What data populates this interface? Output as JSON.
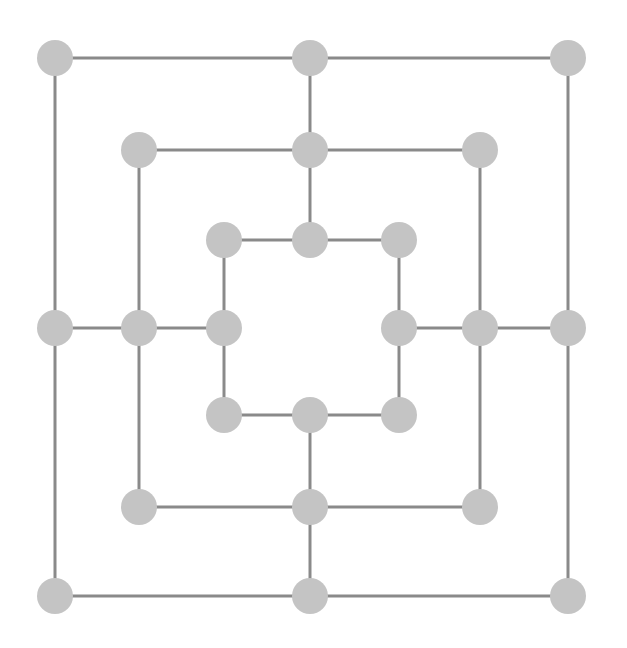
{
  "figure": {
    "kind": "graph-diagram",
    "width": 627,
    "height": 648,
    "background_color": "#ffffff"
  },
  "style": {
    "node_fill": "#c4c4c4",
    "node_stroke": "none",
    "node_radius": 18,
    "edge_color": "#8a8a8a",
    "edge_width": 3
  },
  "graph": {
    "node_count": 24,
    "edge_count": 32,
    "rings": [
      {
        "name": "outer",
        "xs": [
          55,
          310,
          568
        ],
        "ys": [
          58,
          328,
          596
        ]
      },
      {
        "name": "middle",
        "xs": [
          139,
          310,
          480
        ],
        "ys": [
          150,
          328,
          507
        ]
      },
      {
        "name": "inner",
        "xs": [
          224,
          310,
          399
        ],
        "ys": [
          240,
          328,
          415
        ]
      }
    ],
    "nodes": [
      {
        "id": "o-nw",
        "ring": "outer",
        "x": 55,
        "y": 58
      },
      {
        "id": "o-n",
        "ring": "outer",
        "x": 310,
        "y": 58
      },
      {
        "id": "o-ne",
        "ring": "outer",
        "x": 568,
        "y": 58
      },
      {
        "id": "o-w",
        "ring": "outer",
        "x": 55,
        "y": 328
      },
      {
        "id": "o-e",
        "ring": "outer",
        "x": 568,
        "y": 328
      },
      {
        "id": "o-sw",
        "ring": "outer",
        "x": 55,
        "y": 596
      },
      {
        "id": "o-s",
        "ring": "outer",
        "x": 310,
        "y": 596
      },
      {
        "id": "o-se",
        "ring": "outer",
        "x": 568,
        "y": 596
      },
      {
        "id": "m-nw",
        "ring": "middle",
        "x": 139,
        "y": 150
      },
      {
        "id": "m-n",
        "ring": "middle",
        "x": 310,
        "y": 150
      },
      {
        "id": "m-ne",
        "ring": "middle",
        "x": 480,
        "y": 150
      },
      {
        "id": "m-w",
        "ring": "middle",
        "x": 139,
        "y": 328
      },
      {
        "id": "m-e",
        "ring": "middle",
        "x": 480,
        "y": 328
      },
      {
        "id": "m-sw",
        "ring": "middle",
        "x": 139,
        "y": 507
      },
      {
        "id": "m-s",
        "ring": "middle",
        "x": 310,
        "y": 507
      },
      {
        "id": "m-se",
        "ring": "middle",
        "x": 480,
        "y": 507
      },
      {
        "id": "i-nw",
        "ring": "inner",
        "x": 224,
        "y": 240
      },
      {
        "id": "i-n",
        "ring": "inner",
        "x": 310,
        "y": 240
      },
      {
        "id": "i-ne",
        "ring": "inner",
        "x": 399,
        "y": 240
      },
      {
        "id": "i-w",
        "ring": "inner",
        "x": 224,
        "y": 328
      },
      {
        "id": "i-e",
        "ring": "inner",
        "x": 399,
        "y": 328
      },
      {
        "id": "i-sw",
        "ring": "inner",
        "x": 224,
        "y": 415
      },
      {
        "id": "i-s",
        "ring": "inner",
        "x": 310,
        "y": 415
      },
      {
        "id": "i-se",
        "ring": "inner",
        "x": 399,
        "y": 415
      }
    ],
    "edges": [
      [
        "o-nw",
        "o-n"
      ],
      [
        "o-n",
        "o-ne"
      ],
      [
        "o-nw",
        "o-w"
      ],
      [
        "o-w",
        "o-sw"
      ],
      [
        "o-ne",
        "o-e"
      ],
      [
        "o-e",
        "o-se"
      ],
      [
        "o-sw",
        "o-s"
      ],
      [
        "o-s",
        "o-se"
      ],
      [
        "m-nw",
        "m-n"
      ],
      [
        "m-n",
        "m-ne"
      ],
      [
        "m-nw",
        "m-w"
      ],
      [
        "m-w",
        "m-sw"
      ],
      [
        "m-ne",
        "m-e"
      ],
      [
        "m-e",
        "m-se"
      ],
      [
        "m-sw",
        "m-s"
      ],
      [
        "m-s",
        "m-se"
      ],
      [
        "i-nw",
        "i-n"
      ],
      [
        "i-n",
        "i-ne"
      ],
      [
        "i-nw",
        "i-w"
      ],
      [
        "i-w",
        "i-sw"
      ],
      [
        "i-ne",
        "i-e"
      ],
      [
        "i-e",
        "i-se"
      ],
      [
        "i-sw",
        "i-s"
      ],
      [
        "i-s",
        "i-se"
      ],
      [
        "o-n",
        "m-n"
      ],
      [
        "m-n",
        "i-n"
      ],
      [
        "o-w",
        "m-w"
      ],
      [
        "m-w",
        "i-w"
      ],
      [
        "o-e",
        "m-e"
      ],
      [
        "m-e",
        "i-e"
      ],
      [
        "o-s",
        "m-s"
      ],
      [
        "m-s",
        "i-s"
      ]
    ]
  }
}
